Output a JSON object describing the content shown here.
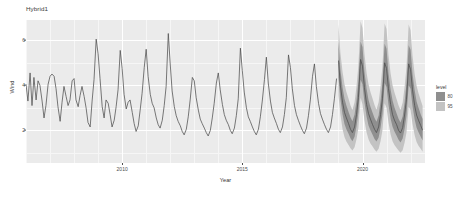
{
  "chart_data": {
    "type": "line",
    "title": "Hybrid1",
    "xlabel": "Year",
    "ylabel": "Wind",
    "xlim": [
      2006.0,
      2022.6
    ],
    "ylim": [
      0.55,
      6.9
    ],
    "grid": true,
    "legend": {
      "position": "right",
      "title": "level",
      "entries": [
        {
          "label": "80",
          "color": "#8f8f8f"
        },
        {
          "label": "95",
          "color": "#c3c3c3"
        }
      ]
    },
    "xticks": [
      2010,
      2015,
      2020
    ],
    "yticks": [
      2,
      4,
      6
    ],
    "series": [
      {
        "name": "Wind",
        "type": "historical-line",
        "color": "#4d4d4d",
        "x": [
          2006.0,
          2006.08,
          2006.17,
          2006.25,
          2006.33,
          2006.42,
          2006.5,
          2006.58,
          2006.67,
          2006.75,
          2006.83,
          2006.92,
          2007.0,
          2007.08,
          2007.17,
          2007.25,
          2007.33,
          2007.42,
          2007.5,
          2007.58,
          2007.67,
          2007.75,
          2007.83,
          2007.92,
          2008.0,
          2008.08,
          2008.17,
          2008.25,
          2008.33,
          2008.42,
          2008.5,
          2008.58,
          2008.67,
          2008.75,
          2008.83,
          2008.92,
          2009.0,
          2009.08,
          2009.17,
          2009.25,
          2009.33,
          2009.42,
          2009.5,
          2009.58,
          2009.67,
          2009.75,
          2009.83,
          2009.92,
          2010.0,
          2010.08,
          2010.17,
          2010.25,
          2010.33,
          2010.42,
          2010.5,
          2010.58,
          2010.67,
          2010.75,
          2010.83,
          2010.92,
          2011.0,
          2011.08,
          2011.17,
          2011.25,
          2011.33,
          2011.42,
          2011.5,
          2011.58,
          2011.67,
          2011.75,
          2011.83,
          2011.92,
          2012.0,
          2012.08,
          2012.17,
          2012.25,
          2012.33,
          2012.42,
          2012.5,
          2012.58,
          2012.67,
          2012.75,
          2012.83,
          2012.92,
          2013.0,
          2013.08,
          2013.17,
          2013.25,
          2013.33,
          2013.42,
          2013.5,
          2013.58,
          2013.67,
          2013.75,
          2013.83,
          2013.92,
          2014.0,
          2014.08,
          2014.17,
          2014.25,
          2014.33,
          2014.42,
          2014.5,
          2014.58,
          2014.67,
          2014.75,
          2014.83,
          2014.92,
          2015.0,
          2015.08,
          2015.17,
          2015.25,
          2015.33,
          2015.42,
          2015.5,
          2015.58,
          2015.67,
          2015.75,
          2015.83,
          2015.92,
          2016.0,
          2016.08,
          2016.17,
          2016.25,
          2016.33,
          2016.42,
          2016.5,
          2016.58,
          2016.67,
          2016.75,
          2016.83,
          2016.92,
          2017.0,
          2017.08,
          2017.17,
          2017.25,
          2017.33,
          2017.42,
          2017.5,
          2017.58,
          2017.67,
          2017.75,
          2017.83,
          2017.92,
          2018.0,
          2018.08,
          2018.17,
          2018.25,
          2018.33,
          2018.42,
          2018.5,
          2018.58,
          2018.67,
          2018.75,
          2018.83,
          2018.92
        ],
        "y": [
          4.05,
          3.3,
          4.55,
          3.1,
          4.35,
          3.35,
          4.2,
          4.0,
          3.3,
          2.55,
          3.1,
          4.05,
          4.4,
          4.5,
          4.4,
          3.85,
          3.05,
          2.4,
          3.25,
          3.95,
          3.5,
          3.1,
          3.35,
          4.2,
          4.3,
          3.35,
          3.05,
          3.55,
          3.95,
          3.5,
          3.0,
          2.35,
          2.15,
          3.3,
          4.25,
          6.05,
          5.4,
          4.3,
          3.05,
          2.55,
          3.35,
          3.2,
          2.7,
          2.15,
          2.45,
          3.05,
          3.8,
          5.55,
          4.75,
          3.6,
          2.95,
          3.25,
          3.35,
          2.8,
          2.3,
          1.95,
          2.2,
          2.9,
          3.65,
          4.8,
          5.6,
          4.4,
          3.6,
          3.2,
          3.0,
          2.55,
          2.25,
          2.1,
          2.45,
          3.1,
          3.95,
          6.3,
          4.95,
          3.75,
          3.05,
          2.65,
          2.4,
          2.2,
          1.95,
          1.8,
          2.05,
          2.6,
          3.35,
          4.35,
          4.2,
          3.45,
          2.9,
          2.5,
          2.3,
          2.1,
          1.9,
          1.75,
          2.0,
          2.55,
          3.2,
          4.1,
          4.55,
          3.8,
          3.15,
          2.7,
          2.45,
          2.25,
          2.0,
          1.85,
          2.1,
          2.65,
          3.4,
          5.65,
          4.65,
          3.7,
          3.0,
          2.6,
          2.4,
          2.15,
          1.95,
          1.8,
          2.05,
          2.6,
          3.3,
          4.25,
          5.25,
          4.1,
          3.3,
          2.8,
          2.55,
          2.3,
          2.05,
          1.9,
          2.15,
          2.7,
          3.45,
          5.35,
          4.8,
          3.85,
          3.1,
          2.7,
          2.45,
          2.2,
          2.0,
          1.85,
          2.1,
          2.65,
          3.35,
          4.4,
          4.95,
          3.95,
          3.2,
          2.75,
          2.5,
          2.25,
          2.05,
          1.9,
          2.15,
          2.7,
          3.4,
          4.3
        ]
      },
      {
        "name": "Forecast mean",
        "type": "forecast-line",
        "color": "#4d4d4d",
        "x": [
          2019.0,
          2019.08,
          2019.17,
          2019.25,
          2019.33,
          2019.42,
          2019.5,
          2019.58,
          2019.67,
          2019.75,
          2019.83,
          2019.92,
          2020.0,
          2020.08,
          2020.17,
          2020.25,
          2020.33,
          2020.42,
          2020.5,
          2020.58,
          2020.67,
          2020.75,
          2020.83,
          2020.92,
          2021.0,
          2021.08,
          2021.17,
          2021.25,
          2021.33,
          2021.42,
          2021.5,
          2021.58,
          2021.67,
          2021.75,
          2021.83,
          2021.92,
          2022.0,
          2022.08,
          2022.17,
          2022.25,
          2022.33,
          2022.42,
          2022.5
        ],
        "y": [
          5.1,
          4.0,
          3.25,
          2.8,
          2.55,
          2.3,
          2.05,
          1.9,
          2.15,
          2.7,
          3.45,
          5.15,
          4.85,
          3.9,
          3.15,
          2.75,
          2.5,
          2.25,
          2.05,
          1.9,
          2.15,
          2.7,
          3.4,
          5.0,
          4.75,
          3.85,
          3.15,
          2.7,
          2.45,
          2.25,
          2.0,
          1.88,
          2.12,
          2.68,
          3.38,
          4.95,
          4.7,
          3.8,
          3.1,
          2.68,
          2.45,
          2.22,
          2.0
        ]
      },
      {
        "name": "95% interval",
        "type": "ribbon",
        "color": "#c3c3c3",
        "x": [
          2019.0,
          2019.08,
          2019.17,
          2019.25,
          2019.33,
          2019.42,
          2019.5,
          2019.58,
          2019.67,
          2019.75,
          2019.83,
          2019.92,
          2020.0,
          2020.08,
          2020.17,
          2020.25,
          2020.33,
          2020.42,
          2020.5,
          2020.58,
          2020.67,
          2020.75,
          2020.83,
          2020.92,
          2021.0,
          2021.08,
          2021.17,
          2021.25,
          2021.33,
          2021.42,
          2021.5,
          2021.58,
          2021.67,
          2021.75,
          2021.83,
          2021.92,
          2022.0,
          2022.08,
          2022.17,
          2022.25,
          2022.33,
          2022.42,
          2022.5
        ],
        "lower": [
          3.55,
          2.7,
          2.05,
          1.7,
          1.5,
          1.35,
          1.2,
          1.1,
          1.25,
          1.6,
          2.1,
          3.45,
          3.15,
          2.45,
          1.9,
          1.6,
          1.42,
          1.28,
          1.15,
          1.05,
          1.18,
          1.52,
          2.0,
          3.2,
          3.0,
          2.35,
          1.82,
          1.52,
          1.35,
          1.22,
          1.1,
          1.0,
          1.12,
          1.45,
          1.9,
          3.05,
          2.9,
          2.28,
          1.78,
          1.48,
          1.32,
          1.18,
          1.05
        ],
        "upper": [
          6.7,
          5.45,
          4.6,
          4.05,
          3.7,
          3.4,
          3.1,
          2.9,
          3.25,
          3.95,
          4.9,
          6.85,
          6.55,
          5.4,
          4.55,
          4.05,
          3.7,
          3.4,
          3.12,
          2.92,
          3.25,
          3.95,
          4.85,
          6.75,
          6.5,
          5.35,
          4.52,
          4.0,
          3.68,
          3.38,
          3.1,
          2.9,
          3.22,
          3.92,
          4.82,
          6.7,
          6.45,
          5.32,
          4.5,
          3.98,
          3.65,
          3.35,
          3.08
        ]
      },
      {
        "name": "80% interval",
        "type": "ribbon",
        "color": "#8f8f8f",
        "x": [
          2019.0,
          2019.08,
          2019.17,
          2019.25,
          2019.33,
          2019.42,
          2019.5,
          2019.58,
          2019.67,
          2019.75,
          2019.83,
          2019.92,
          2020.0,
          2020.08,
          2020.17,
          2020.25,
          2020.33,
          2020.42,
          2020.5,
          2020.58,
          2020.67,
          2020.75,
          2020.83,
          2020.92,
          2021.0,
          2021.08,
          2021.17,
          2021.25,
          2021.33,
          2021.42,
          2021.5,
          2021.58,
          2021.67,
          2021.75,
          2021.83,
          2021.92,
          2022.0,
          2022.08,
          2022.17,
          2022.25,
          2022.33,
          2022.42,
          2022.5
        ],
        "lower": [
          4.35,
          3.4,
          2.7,
          2.28,
          2.05,
          1.85,
          1.65,
          1.52,
          1.72,
          2.18,
          2.8,
          4.25,
          4.05,
          3.25,
          2.6,
          2.22,
          2.0,
          1.8,
          1.62,
          1.5,
          1.68,
          2.12,
          2.72,
          4.1,
          3.92,
          3.15,
          2.52,
          2.16,
          1.95,
          1.76,
          1.58,
          1.46,
          1.64,
          2.06,
          2.65,
          4.0,
          3.85,
          3.08,
          2.48,
          2.12,
          1.92,
          1.72,
          1.55
        ],
        "upper": [
          5.95,
          4.7,
          3.9,
          3.4,
          3.1,
          2.82,
          2.58,
          2.4,
          2.7,
          3.32,
          4.18,
          5.95,
          5.7,
          4.6,
          3.85,
          3.35,
          3.05,
          2.78,
          2.55,
          2.38,
          2.66,
          3.28,
          4.12,
          5.85,
          5.62,
          4.55,
          3.8,
          3.32,
          3.02,
          2.75,
          2.52,
          2.35,
          2.62,
          3.24,
          4.08,
          5.78,
          5.58,
          4.5,
          3.78,
          3.28,
          3.0,
          2.72,
          2.5
        ]
      }
    ]
  }
}
